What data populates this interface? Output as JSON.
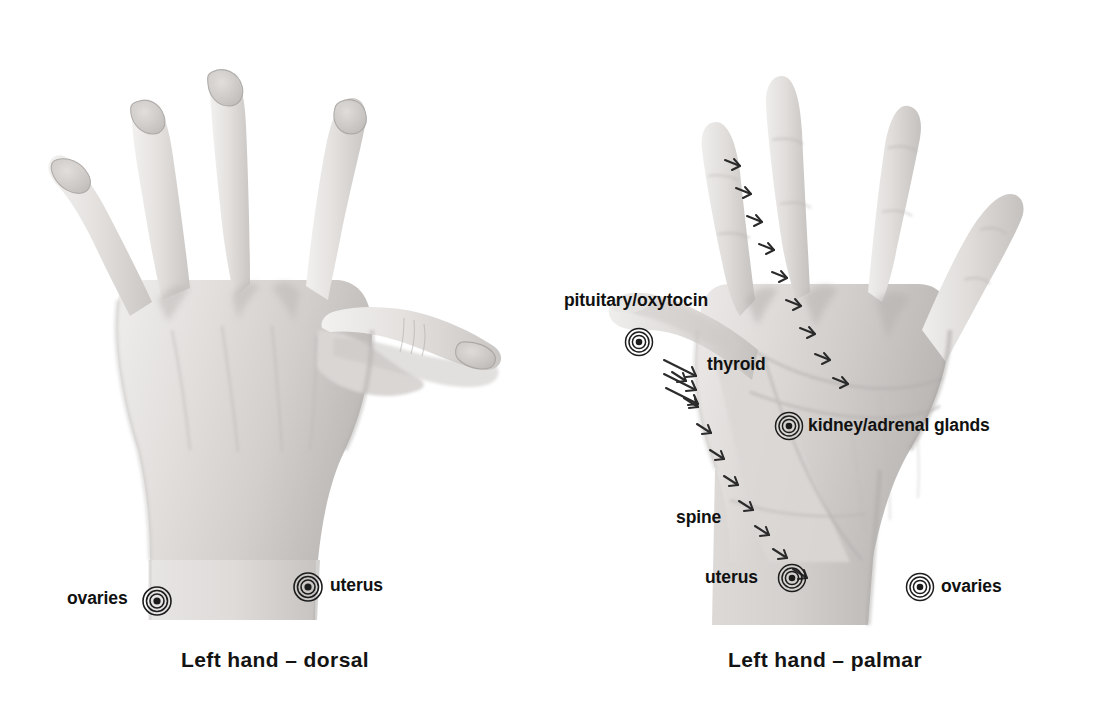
{
  "figure": {
    "background_color": "#ffffff",
    "text_color": "#111111"
  },
  "panels": [
    {
      "id": "dorsal",
      "caption": "Left hand – dorsal",
      "view": "dorsal",
      "hand": "left",
      "labels": [
        {
          "id": "ovaries-dorsal",
          "text": "ovaries",
          "marker": "concentric-circles"
        },
        {
          "id": "uterus-dorsal",
          "text": "uterus",
          "marker": "concentric-circles"
        }
      ]
    },
    {
      "id": "palmar",
      "caption": "Left hand – palmar",
      "view": "palmar",
      "hand": "left",
      "labels": [
        {
          "id": "pituitary-oxytocin",
          "text": "pituitary/oxytocin",
          "marker": "concentric-circles"
        },
        {
          "id": "thyroid",
          "text": "thyroid",
          "marker": "arrow-stripes"
        },
        {
          "id": "kidney-adrenal",
          "text": "kidney/adrenal glands",
          "marker": "concentric-circles"
        },
        {
          "id": "spine",
          "text": "spine",
          "marker": "vertebra-chain"
        },
        {
          "id": "uterus-palmar",
          "text": "uterus",
          "marker": "concentric-circles"
        },
        {
          "id": "ovaries-palmar",
          "text": "ovaries",
          "marker": "concentric-circles"
        }
      ]
    }
  ],
  "labels_text": {
    "ovaries_left": "ovaries",
    "uterus_left": "uterus",
    "pituitary_oxytocin": "pituitary/oxytocin",
    "thyroid": "thyroid",
    "kidney_adrenal_glands": "kidney/adrenal glands",
    "spine": "spine",
    "uterus_right": "uterus",
    "ovaries_right": "ovaries",
    "caption_dorsal": "Left hand – dorsal",
    "caption_palmar": "Left hand – palmar"
  },
  "colors": {
    "background": "#ffffff",
    "text": "#111111",
    "marker_stroke": "#1c1c1c",
    "skin_light": "#e8e6e4",
    "skin_mid": "#cfcccb",
    "skin_shadow": "#a9a6a5"
  }
}
